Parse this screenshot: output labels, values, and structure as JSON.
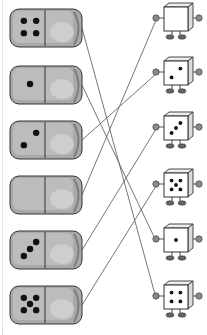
{
  "worksheet": {
    "task": "match-domino-to-dice",
    "colors": {
      "domino_fill": "#a9a9a9",
      "domino_light": "#c9c9c9",
      "domino_dark": "#7d7d7d",
      "outline": "#333333",
      "pip": "#111111",
      "line": "#666666",
      "cube_fill": "#ffffff",
      "hand": "#8a8a8a"
    },
    "dominoes": [
      {
        "index": 1,
        "pips": 4,
        "y": 28
      },
      {
        "index": 2,
        "pips": 1,
        "y": 85
      },
      {
        "index": 3,
        "pips": 2,
        "y": 140
      },
      {
        "index": 4,
        "pips": 0,
        "y": 195
      },
      {
        "index": 5,
        "pips": 3,
        "y": 250
      },
      {
        "index": 6,
        "pips": 5,
        "y": 305
      }
    ],
    "dice_characters": [
      {
        "index": 1,
        "pips": 0,
        "y": 22
      },
      {
        "index": 2,
        "pips": 2,
        "y": 76
      },
      {
        "index": 3,
        "pips": 3,
        "y": 131
      },
      {
        "index": 4,
        "pips": 5,
        "y": 188
      },
      {
        "index": 5,
        "pips": 1,
        "y": 243
      },
      {
        "index": 6,
        "pips": 4,
        "y": 300
      }
    ],
    "connections": [
      {
        "from_domino": 1,
        "to_die": 6
      },
      {
        "from_domino": 2,
        "to_die": 5
      },
      {
        "from_domino": 3,
        "to_die": 2
      },
      {
        "from_domino": 4,
        "to_die": 1
      },
      {
        "from_domino": 5,
        "to_die": 3
      },
      {
        "from_domino": 6,
        "to_die": 4
      }
    ]
  }
}
